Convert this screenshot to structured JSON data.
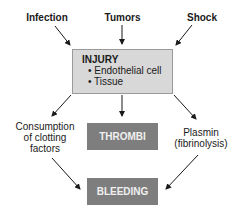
{
  "diagram": {
    "causes": {
      "infection": "Infection",
      "tumors": "Tumors",
      "shock": "Shock"
    },
    "injury": {
      "title": "INJURY",
      "items": [
        "• Endothelial cell",
        "• Tissue"
      ]
    },
    "consumption": [
      "Consumption",
      "of clotting",
      "factors"
    ],
    "plasmin": [
      "Plasmin",
      "(fibrinolysis)"
    ],
    "thrombi": "THROMBI",
    "bleeding": "BLEEDING",
    "colors": {
      "injury_fill": "#d8d8d8",
      "result_fill": "#7e7e7e",
      "arrow": "#1a1a1a"
    }
  }
}
